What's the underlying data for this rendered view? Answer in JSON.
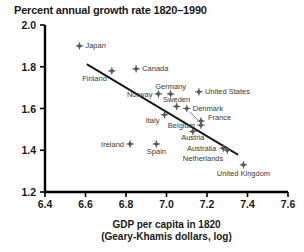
{
  "chart_data": {
    "type": "scatter",
    "title": "Percent annual growth rate 1820–1990",
    "xlabel_line1": "GDP per capita in 1820",
    "xlabel_line2": "(Geary-Khamis dollars, log)",
    "ylabel": "",
    "xlim": [
      6.4,
      7.6
    ],
    "ylim": [
      1.2,
      2.0
    ],
    "xticks": [
      "6.4",
      "6.6",
      "6.8",
      "7.0",
      "7.2",
      "7.4",
      "7.6"
    ],
    "yticks": [
      "1.2",
      "1.4",
      "1.6",
      "1.8",
      "2.0"
    ],
    "grid": false,
    "legend": "none",
    "marker_color": "#5a5a5a",
    "line_color": "#1a1a1a",
    "axis_color": "#000000",
    "points": [
      {
        "label": "Japan",
        "x": 6.57,
        "y": 1.9,
        "label_dx": 6,
        "label_dy": 2.5,
        "anchor": "start"
      },
      {
        "label": "Finland",
        "x": 6.73,
        "y": 1.78,
        "label_dx": -5,
        "label_dy": 10,
        "anchor": "end"
      },
      {
        "label": "Canada",
        "x": 6.85,
        "y": 1.79,
        "label_dx": 6,
        "label_dy": 2.5,
        "anchor": "start"
      },
      {
        "label": "Norway",
        "x": 6.96,
        "y": 1.67,
        "label_dx": -6,
        "label_dy": 3,
        "anchor": "end"
      },
      {
        "label": "Germany",
        "x": 7.02,
        "y": 1.67,
        "label_dx": 0,
        "label_dy": -5,
        "anchor": "middle"
      },
      {
        "label": "United States",
        "x": 7.16,
        "y": 1.68,
        "label_dx": 6,
        "label_dy": 2.5,
        "anchor": "start"
      },
      {
        "label": "Sweden",
        "x": 7.05,
        "y": 1.61,
        "label_dx": 0,
        "label_dy": -4.5,
        "anchor": "middle"
      },
      {
        "label": "Denmark",
        "x": 7.1,
        "y": 1.6,
        "label_dx": 6,
        "label_dy": 2.5,
        "anchor": "start"
      },
      {
        "label": "Italy",
        "x": 6.99,
        "y": 1.57,
        "label_dx": -5,
        "label_dy": 8,
        "anchor": "end"
      },
      {
        "label": "France",
        "x": 7.17,
        "y": 1.54,
        "label_dx": 7,
        "label_dy": -1,
        "anchor": "start"
      },
      {
        "label": "Belgium",
        "x": 7.17,
        "y": 1.52,
        "label_dx": -6,
        "label_dy": 3,
        "anchor": "end"
      },
      {
        "label": "Austria",
        "x": 7.13,
        "y": 1.49,
        "label_dx": 0,
        "label_dy": 9,
        "anchor": "middle"
      },
      {
        "label": "Ireland",
        "x": 6.82,
        "y": 1.43,
        "label_dx": -6,
        "label_dy": 3,
        "anchor": "end"
      },
      {
        "label": "Spain",
        "x": 6.95,
        "y": 1.43,
        "label_dx": 0,
        "label_dy": 10,
        "anchor": "middle"
      },
      {
        "label": "Australia",
        "x": 7.28,
        "y": 1.41,
        "label_dx": -7,
        "label_dy": 3,
        "anchor": "end"
      },
      {
        "label": "Netherlands",
        "x": 7.3,
        "y": 1.4,
        "label_dx": -4,
        "label_dy": 11,
        "anchor": "end"
      },
      {
        "label": "United Kingdom",
        "x": 7.38,
        "y": 1.33,
        "label_dx": 0,
        "label_dy": 11,
        "anchor": "middle"
      }
    ],
    "trend_line": {
      "x1": 6.61,
      "y1": 1.81,
      "x2": 7.35,
      "y2": 1.38
    },
    "leader_lines": [
      {
        "x1": 7.155,
        "y1": 1.545,
        "x2": 7.115,
        "y2": 1.585
      }
    ]
  }
}
